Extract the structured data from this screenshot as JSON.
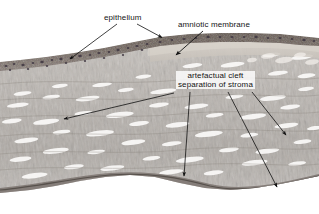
{
  "figure": {
    "kind": "histology-micrograph",
    "width": 319,
    "height": 214,
    "background": "#ffffff",
    "stain_colors": {
      "stroma_light": "#d8d4cf",
      "stroma_mid": "#b2aca6",
      "stroma_dark": "#8a837d",
      "epithelium_band": "#6f6259",
      "nuclei": "#4a3f4a",
      "membrane_pale": "#cfc9c2",
      "cleft_line": "#6b645e",
      "white_space": "#ffffff"
    }
  },
  "labels": {
    "epithelium": "epithelium",
    "amniotic_membrane": "amniotic membrane",
    "artefactual_cleft_line1": "artefactual cleft",
    "artefactual_cleft_line2": "separation of stroma"
  },
  "annotations": {
    "text_color": "#141414",
    "arrow_color": "#111111",
    "arrows": [
      {
        "name": "epithelium-left",
        "from": [
          117,
          24
        ],
        "to": [
          68,
          60
        ]
      },
      {
        "name": "epithelium-right",
        "from": [
          137,
          24
        ],
        "to": [
          164,
          38
        ]
      },
      {
        "name": "amniotic-membrane",
        "from": [
          203,
          31
        ],
        "to": [
          174,
          56
        ]
      },
      {
        "name": "cleft-far-left",
        "from": [
          174,
          93
        ],
        "to": [
          62,
          120
        ]
      },
      {
        "name": "cleft-left",
        "from": [
          190,
          92
        ],
        "to": [
          184,
          178
        ]
      },
      {
        "name": "cleft-middle",
        "from": [
          228,
          92
        ],
        "to": [
          278,
          189
        ]
      },
      {
        "name": "cleft-right",
        "from": [
          252,
          92
        ],
        "to": [
          287,
          137
        ]
      }
    ]
  }
}
